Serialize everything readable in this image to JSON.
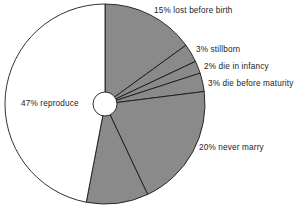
{
  "chart_data": {
    "type": "pie",
    "title": "",
    "subtitle": "",
    "xlabel": "",
    "ylabel": "",
    "legend_position": "none",
    "grid": false,
    "start_angle_deg": 0,
    "direction": "clockwise",
    "donut_hole": true,
    "categories": [
      "lost before birth",
      "stillborn",
      "die in infancy",
      "die before maturity",
      "never marry",
      "marry but remain childless",
      "reproduce"
    ],
    "values": [
      15,
      3,
      2,
      3,
      20,
      10,
      47
    ],
    "unit": "%",
    "labels": [
      "15% lost before birth",
      "3% stillborn",
      "2% die in infancy",
      "3% die before maturity",
      "20% never marry",
      "10% marry but remain childless",
      "47% reproduce"
    ],
    "slice_colors": [
      "#8a8a8a",
      "#8a8a8a",
      "#8a8a8a",
      "#8a8a8a",
      "#8a8a8a",
      "#8a8a8a",
      "#ffffff"
    ],
    "outline_color": "#1a1a1a"
  },
  "chart": {
    "slices": [
      {
        "label": "15% lost before birth",
        "value": 15,
        "color": "#8a8a8a"
      },
      {
        "label": "3% stillborn",
        "value": 3,
        "color": "#8a8a8a"
      },
      {
        "label": "2% die in infancy",
        "value": 2,
        "color": "#8a8a8a"
      },
      {
        "label": "3% die before maturity",
        "value": 3,
        "color": "#8a8a8a"
      },
      {
        "label": "20% never marry",
        "value": 20,
        "color": "#8a8a8a"
      },
      {
        "label": "",
        "value": 10,
        "color": "#8a8a8a"
      },
      {
        "label": "47% reproduce",
        "value": 47,
        "color": "#ffffff"
      }
    ],
    "labels": {
      "lost_before_birth": "15% lost before birth",
      "stillborn": "3% stillborn",
      "die_in_infancy": "2% die in infancy",
      "die_before_maturity": "3% die before maturity",
      "never_marry": "20% never marry",
      "reproduce": "47% reproduce",
      "bottom_cut_off": ""
    },
    "geometry": {
      "center_x": 105,
      "center_y": 104,
      "radius": 100,
      "hole_radius": 12
    },
    "colors": {
      "slice_gray": "#8a8a8a",
      "slice_white": "#ffffff",
      "outline": "#1a1a1a",
      "text": "#232323",
      "background": "#ffffff"
    }
  }
}
